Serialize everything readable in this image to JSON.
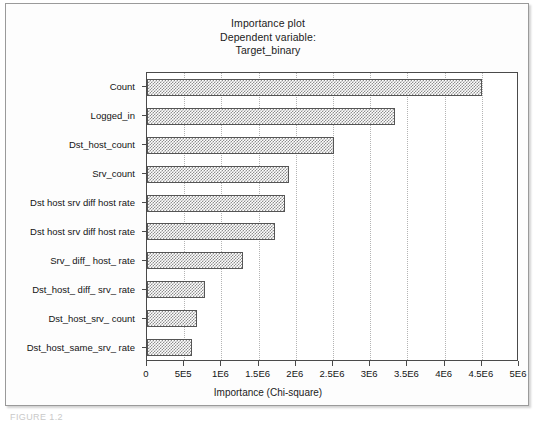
{
  "figure": {
    "caption": "FIGURE 1.2"
  },
  "chart_data": {
    "type": "bar",
    "orientation": "horizontal",
    "title": "Importance plot",
    "subtitle": "Dependent variable:",
    "subtitle2": "Target_binary",
    "xlabel": "Importance (Chi-square)",
    "ylabel": "",
    "xlim": [
      0,
      5000000
    ],
    "grid": true,
    "legend": false,
    "xtick_labels": [
      "0",
      "5E5",
      "1E6",
      "1.5E6",
      "2E6",
      "2.5E6",
      "3E6",
      "3.5E6",
      "4E6",
      "4.5E6",
      "5E6"
    ],
    "xtick_values": [
      0,
      500000,
      1000000,
      1500000,
      2000000,
      2500000,
      3000000,
      3500000,
      4000000,
      4500000,
      5000000
    ],
    "categories": [
      "Count",
      "Logged_in",
      "Dst_host_count",
      "Srv_count",
      "Dst host srv diff host rate",
      "Dst host srv diff host rate",
      "Srv_ diff_ host_ rate",
      "Dst_host_ diff_ srv_ rate",
      "Dst_host_srv_ count",
      "Dst_host_same_srv_ rate"
    ],
    "values": [
      4500000,
      3330000,
      2520000,
      1910000,
      1850000,
      1720000,
      1290000,
      780000,
      670000,
      600000
    ]
  }
}
